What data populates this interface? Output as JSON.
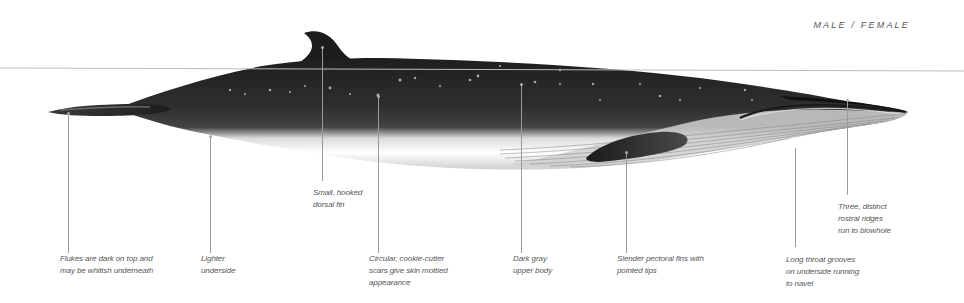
{
  "header": {
    "gender_label": "MALE / FEMALE"
  },
  "illustration": {
    "subject": "whale-side-profile",
    "colors": {
      "upper_body": "#2b2b2b",
      "underside": "#ffffff",
      "waterline": "#bdbdbd",
      "leader_line": "#9a9a9a",
      "text": "#555555"
    }
  },
  "callouts": [
    {
      "id": "flukes",
      "lines": [
        "Flukes are dark on top and",
        "may be whitish underneath"
      ]
    },
    {
      "id": "underside",
      "lines": [
        "Lighter",
        "underside"
      ]
    },
    {
      "id": "dorsal-fin",
      "lines": [
        "Small, hooked",
        "dorsal fin"
      ]
    },
    {
      "id": "scars",
      "lines": [
        "Circular, cookie-cutter",
        "scars give skin mottled",
        "appearance"
      ]
    },
    {
      "id": "upper-body",
      "lines": [
        "Dark gray",
        "upper body"
      ]
    },
    {
      "id": "pectoral-fins",
      "lines": [
        "Slender pectoral fins with",
        "pointed tips"
      ]
    },
    {
      "id": "throat-grooves",
      "lines": [
        "Long throat grooves",
        "on underside running",
        "to navel"
      ]
    },
    {
      "id": "rostral-ridges",
      "lines": [
        "Three, distinct",
        "rostral ridges",
        "run to blowhole"
      ]
    }
  ]
}
